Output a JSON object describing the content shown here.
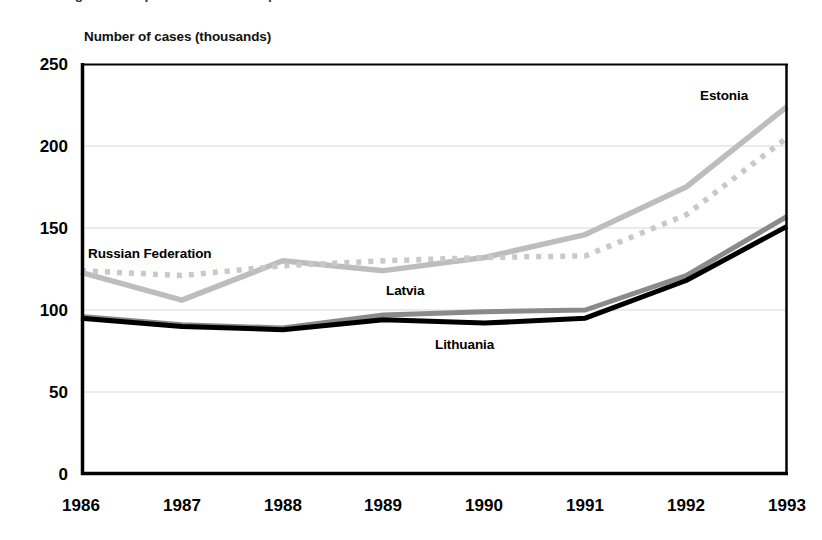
{
  "top_cut_caption": "Figure 3. Reported cases of diphtheria in the Baltic States and the Russian Federation",
  "axis_title": "Number of  cases (thousands)",
  "series_labels": {
    "estonia": "Estonia",
    "russian_federation": "Russian Federation",
    "latvia": "Latvia",
    "lithuania": "Lithuania"
  },
  "colors": {
    "estonia": "#bdbdbd",
    "russian_federation": "#c9c9c9",
    "latvia": "#8a8a8a",
    "lithuania": "#000000",
    "axis": "#000000",
    "gridline": "#d8d8d8",
    "background": "#ffffff"
  },
  "chart_data": {
    "type": "line",
    "title": "Number of  cases (thousands)",
    "xlabel": "",
    "ylabel": "Number of  cases (thousands)",
    "categories": [
      "1986",
      "1987",
      "1988",
      "1989",
      "1990",
      "1991",
      "1992",
      "1993"
    ],
    "x": [
      1986,
      1987,
      1988,
      1989,
      1990,
      1991,
      1992,
      1993
    ],
    "xlim": [
      1986,
      1993
    ],
    "ylim": [
      0,
      250
    ],
    "yticks": [
      0,
      50,
      100,
      150,
      200,
      250
    ],
    "grid": true,
    "grid_axis": "y",
    "legend": "inline-labels",
    "series": [
      {
        "name": "Estonia",
        "style": "solid",
        "color": "#bdbdbd",
        "values": [
          123,
          106,
          130,
          124,
          132,
          146,
          175,
          224
        ]
      },
      {
        "name": "Russian Federation",
        "style": "dotted",
        "color": "#c9c9c9",
        "values": [
          124,
          121,
          127,
          130,
          132,
          133,
          158,
          205
        ]
      },
      {
        "name": "Latvia",
        "style": "solid",
        "color": "#8a8a8a",
        "values": [
          96,
          91,
          89,
          97,
          99,
          100,
          121,
          157
        ]
      },
      {
        "name": "Lithuania",
        "style": "solid",
        "color": "#000000",
        "values": [
          95,
          90,
          88,
          94,
          92,
          95,
          118,
          151
        ]
      }
    ]
  }
}
